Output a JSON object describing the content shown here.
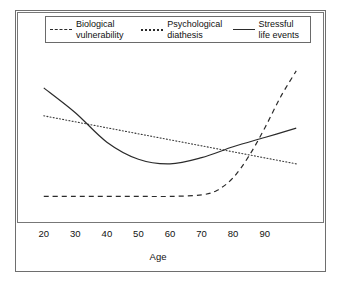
{
  "chart_data": {
    "type": "line",
    "title": "",
    "xlabel": "Age",
    "ylabel": "",
    "xticks": [
      20,
      30,
      40,
      50,
      60,
      70,
      80,
      90
    ],
    "xlim": [
      15,
      105
    ],
    "ylim": [
      0,
      1
    ],
    "grid": false,
    "legend_position": "top-center",
    "series": [
      {
        "name": "Biological vulnerability",
        "label_line1": "Biological",
        "label_line2": "vulnerability",
        "style": "dashed",
        "color": "#2b2b2b",
        "x": [
          20,
          30,
          40,
          50,
          60,
          70,
          75,
          80,
          85,
          90,
          95,
          100
        ],
        "y": [
          0.12,
          0.12,
          0.12,
          0.12,
          0.12,
          0.13,
          0.16,
          0.24,
          0.38,
          0.56,
          0.76,
          0.93
        ]
      },
      {
        "name": "Psychological diathesis",
        "label_line1": "Psychological",
        "label_line2": "diathesis",
        "style": "dotted",
        "color": "#3a3a3a",
        "x": [
          20,
          30,
          40,
          50,
          60,
          70,
          80,
          90,
          100
        ],
        "y": [
          0.64,
          0.6,
          0.56,
          0.52,
          0.48,
          0.44,
          0.4,
          0.36,
          0.33
        ]
      },
      {
        "name": "Stressful life events",
        "label_line1": "Stressful",
        "label_line2": "life events",
        "style": "solid",
        "color": "#2b2b2b",
        "x": [
          20,
          30,
          40,
          50,
          60,
          70,
          80,
          90,
          100
        ],
        "y": [
          0.82,
          0.66,
          0.47,
          0.36,
          0.33,
          0.37,
          0.44,
          0.5,
          0.56
        ]
      }
    ]
  },
  "legend": {
    "entries": [
      {
        "label_line1": "Biological",
        "label_line2": "vulnerability",
        "sample": "dashed-line-icon"
      },
      {
        "label_line1": "Psychological",
        "label_line2": "diathesis",
        "sample": "dotted-line-icon"
      },
      {
        "label_line1": "Stressful",
        "label_line2": "life events",
        "sample": "solid-line-icon"
      }
    ]
  },
  "axis": {
    "x_title": "Age",
    "tick_labels": [
      "20",
      "30",
      "40",
      "50",
      "60",
      "70",
      "80",
      "90"
    ]
  },
  "colors": {
    "frame": "#6e6e6e",
    "line": "#2b2b2b",
    "background": "#ffffff",
    "text": "#111111"
  }
}
